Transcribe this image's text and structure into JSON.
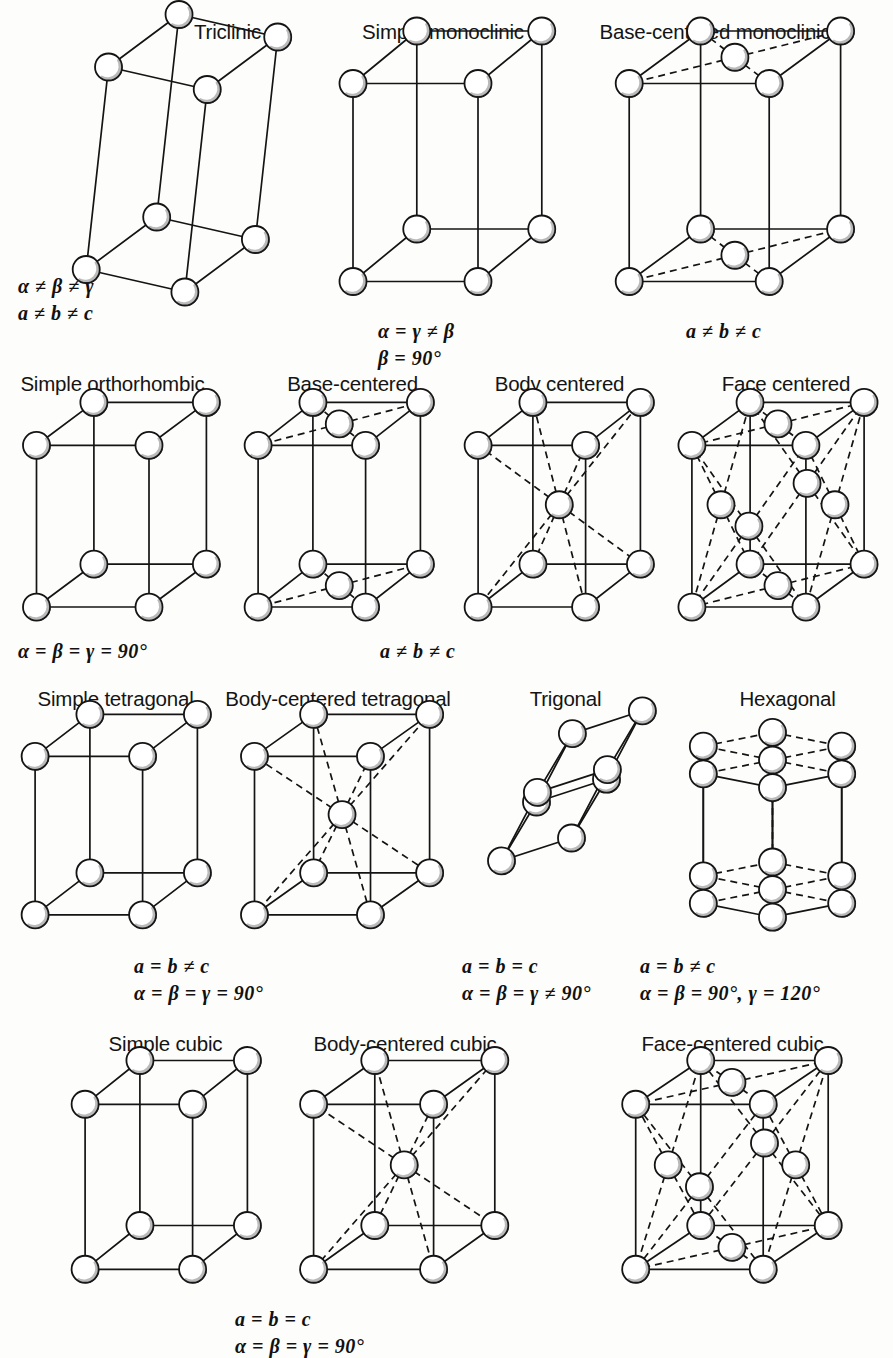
{
  "figure": {
    "background": "#fdfdfb",
    "ink": "#141414"
  },
  "rows": [
    {
      "name": "triclinic-monoclinic-row",
      "cells": [
        {
          "id": "triclinic",
          "title": "Triclinic",
          "lattice": "triclinic",
          "captions": [
            "α ≠ β ≠ γ",
            "a ≠ b ≠ c"
          ]
        },
        {
          "id": "simple-monoclinic",
          "title": "Simple monoclinic",
          "lattice": "simple",
          "captions": [
            "α = γ ≠ β",
            "β = 90°"
          ]
        },
        {
          "id": "base-centered-monoclinic",
          "title": "Base-centered monoclinic",
          "lattice": "base-centered",
          "captions": [
            "a ≠ b ≠ c"
          ]
        }
      ]
    },
    {
      "name": "orthorhombic-row",
      "cells": [
        {
          "id": "simple-orthorhombic",
          "title": "Simple orthorhombic",
          "lattice": "simple",
          "captions": [
            "α = β = γ = 90°"
          ]
        },
        {
          "id": "base-centered-orthorhombic",
          "title": "Base-centered",
          "lattice": "base-centered",
          "captions": []
        },
        {
          "id": "body-centered-orthorhombic",
          "title": "Body centered",
          "lattice": "body-centered",
          "captions": [
            "a ≠ b ≠ c"
          ]
        },
        {
          "id": "face-centered-orthorhombic",
          "title": "Face centered",
          "lattice": "face-centered",
          "captions": []
        }
      ]
    },
    {
      "name": "tetragonal-trigonal-hexagonal-row",
      "cells": [
        {
          "id": "simple-tetragonal",
          "title": "Simple tetragonal",
          "lattice": "simple",
          "captions": []
        },
        {
          "id": "body-centered-tetragonal",
          "title": "Body-centered tetragonal",
          "lattice": "body-centered",
          "captions": [
            "a = b ≠ c",
            "α = β = γ = 90°"
          ]
        },
        {
          "id": "trigonal",
          "title": "Trigonal",
          "lattice": "trigonal",
          "captions": [
            "a = b = c",
            "α = β = γ ≠ 90°"
          ]
        },
        {
          "id": "hexagonal",
          "title": "Hexagonal",
          "lattice": "hexagonal",
          "captions": [
            "a = b ≠ c",
            "α = β = 90°, γ = 120°"
          ]
        }
      ]
    },
    {
      "name": "cubic-row",
      "cells": [
        {
          "id": "simple-cubic",
          "title": "Simple cubic",
          "lattice": "simple",
          "captions": []
        },
        {
          "id": "body-centered-cubic",
          "title": "Body-centered cubic",
          "lattice": "body-centered",
          "captions": [
            "a = b = c",
            "α = β = γ = 90°"
          ]
        },
        {
          "id": "face-centered-cubic",
          "title": "Face-centered cubic",
          "lattice": "face-centered",
          "captions": []
        }
      ]
    }
  ]
}
